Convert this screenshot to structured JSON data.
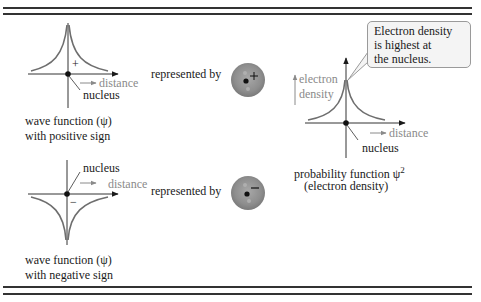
{
  "figure": {
    "panels": [
      {
        "id": "positive",
        "caption_line1": "wave function (ψ)",
        "caption_line2": "with positive sign",
        "sign": "+",
        "axis_label": "distance",
        "nucleus_label": "nucleus",
        "represented_by": "represented by",
        "orbital_sign": "+"
      },
      {
        "id": "negative",
        "caption_line1": "wave function (ψ)",
        "caption_line2": "with negative sign",
        "sign": "−",
        "axis_label": "distance",
        "nucleus_label": "nucleus",
        "represented_by": "represented by",
        "orbital_sign": "−"
      }
    ],
    "probability": {
      "y_label_line1": "electron",
      "y_label_line2": "density",
      "axis_label": "distance",
      "nucleus_label": "nucleus",
      "caption_line1": "probability function ψ",
      "caption_sup": "2",
      "caption_line2": "(electron density)",
      "callout_line1": "Electron density",
      "callout_line2": "is highest at",
      "callout_line3": "the nucleus."
    },
    "colors": {
      "rule": "#333333",
      "curve": "#6e6e6e",
      "gray_text": "#8a8a8a",
      "orbital": "#8c8c8c",
      "callout_bg": "#f4f4f4"
    }
  }
}
